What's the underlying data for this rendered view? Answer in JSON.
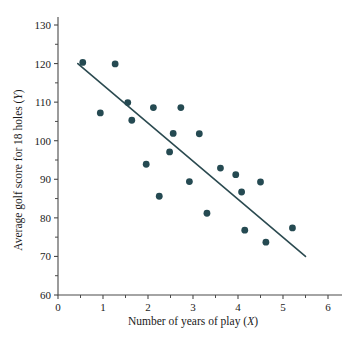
{
  "chart_data": {
    "type": "scatter",
    "title": "",
    "xlabel": "Number of years of play (X)",
    "ylabel": "Average golf score for 18 holes (Y)",
    "xlim": [
      0,
      6
    ],
    "ylim": [
      60,
      130
    ],
    "grid": false,
    "legend": null,
    "x_ticks": [
      "0",
      "1",
      "2",
      "3",
      "4",
      "5",
      "6"
    ],
    "x_tick_values": [
      0,
      1,
      2,
      3,
      4,
      5,
      6
    ],
    "x_minor_tick_values": [
      0.5,
      1.5,
      2.5,
      3.5,
      4.5,
      5.5
    ],
    "y_ticks": [
      "60",
      "70",
      "80",
      "90",
      "100",
      "110",
      "120",
      "130"
    ],
    "y_tick_values": [
      60,
      70,
      80,
      90,
      100,
      110,
      120,
      130
    ],
    "point_color": "#254a52",
    "line_color": "#2b4a50",
    "axis_color": "#4a4a4a",
    "points": [
      {
        "x": 0.55,
        "y": 120.3
      },
      {
        "x": 0.94,
        "y": 107.2
      },
      {
        "x": 1.27,
        "y": 119.9
      },
      {
        "x": 1.55,
        "y": 109.9
      },
      {
        "x": 1.64,
        "y": 105.3
      },
      {
        "x": 1.96,
        "y": 93.9
      },
      {
        "x": 2.12,
        "y": 108.6
      },
      {
        "x": 2.25,
        "y": 85.6
      },
      {
        "x": 2.48,
        "y": 97.1
      },
      {
        "x": 2.56,
        "y": 101.9
      },
      {
        "x": 2.73,
        "y": 108.6
      },
      {
        "x": 2.92,
        "y": 89.4
      },
      {
        "x": 3.14,
        "y": 101.8
      },
      {
        "x": 3.31,
        "y": 81.2
      },
      {
        "x": 3.61,
        "y": 92.9
      },
      {
        "x": 3.95,
        "y": 91.2
      },
      {
        "x": 4.08,
        "y": 86.7
      },
      {
        "x": 4.15,
        "y": 76.8
      },
      {
        "x": 4.5,
        "y": 89.3
      },
      {
        "x": 4.62,
        "y": 73.7
      },
      {
        "x": 5.21,
        "y": 77.4
      }
    ],
    "trend_line": {
      "x1": 0.44,
      "y1": 120.0,
      "x2": 5.5,
      "y2": 70.0
    }
  }
}
